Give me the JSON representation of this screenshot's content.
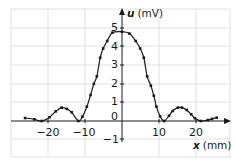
{
  "chart_data": {
    "type": "line",
    "title": "",
    "xlabel": "x (mm)",
    "ylabel": "u (mV)",
    "xlabel_var": "x",
    "xlabel_unit": "(mm)",
    "ylabel_var": "u",
    "ylabel_unit": "(mV)",
    "xlim": [
      -30,
      29
    ],
    "ylim": [
      -2,
      6
    ],
    "x_ticks": [
      -20,
      -10,
      10,
      20
    ],
    "x_tick_labels": [
      "−20",
      "−10",
      "10",
      "20"
    ],
    "y_ticks": [
      -1,
      0,
      1,
      2,
      3,
      4,
      5
    ],
    "y_tick_labels": [
      "−1",
      "0",
      "1",
      "2",
      "3",
      "4",
      "5"
    ],
    "grid": true,
    "markers": true,
    "series": [
      {
        "name": "u(x)",
        "x": [
          -26.2,
          -23.7,
          -21.7,
          -19.6,
          -17.9,
          -16.3,
          -14.9,
          -13.6,
          -11.8,
          -10.7,
          -9.5,
          -8.5,
          -7.6,
          -6.8,
          -5.9,
          -5.1,
          -4.0,
          -2.6,
          0.0,
          2.0,
          3.7,
          4.9,
          5.9,
          6.8,
          7.8,
          8.6,
          9.3,
          10.3,
          11.4,
          12.7,
          13.7,
          15.1,
          16.2,
          17.5,
          18.7,
          19.7,
          21.3,
          23.2,
          24.3,
          25.6
        ],
        "y": [
          0.16,
          0.09,
          0.0,
          0.2,
          0.52,
          0.72,
          0.65,
          0.47,
          0.0,
          0.23,
          0.77,
          1.4,
          2.0,
          2.4,
          3.4,
          3.9,
          4.3,
          4.75,
          4.8,
          4.7,
          4.3,
          3.9,
          3.4,
          2.4,
          1.9,
          1.36,
          0.77,
          0.25,
          0.0,
          0.28,
          0.54,
          0.72,
          0.72,
          0.59,
          0.36,
          0.15,
          0.0,
          0.05,
          0.11,
          0.18
        ]
      }
    ]
  }
}
